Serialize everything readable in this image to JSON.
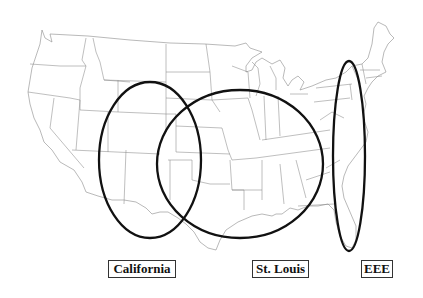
{
  "map": {
    "subject": "Contiguous United States outline map with state borders",
    "style": {
      "background": "#ffffff",
      "state_border_color": "#8a8a8a",
      "ellipse_color": "#111111"
    },
    "regions": [
      {
        "id": "california",
        "label": "California",
        "shape": "ellipse",
        "cx": 150,
        "cy": 160,
        "rx": 51,
        "ry": 78,
        "covers": "Southwest / Colorado, New Mexico, Texas panhandle area"
      },
      {
        "id": "st-louis",
        "label": "St. Louis",
        "shape": "ellipse",
        "cx": 240,
        "cy": 164,
        "rx": 83,
        "ry": 74,
        "covers": "Central / Midwest and South"
      },
      {
        "id": "eee",
        "label": "EEE",
        "shape": "ellipse",
        "cx": 349,
        "cy": 156,
        "rx": 16,
        "ry": 95,
        "covers": "Atlantic seaboard"
      }
    ]
  },
  "labels": {
    "california": "California",
    "st_louis": "St. Louis",
    "eee": "EEE"
  }
}
